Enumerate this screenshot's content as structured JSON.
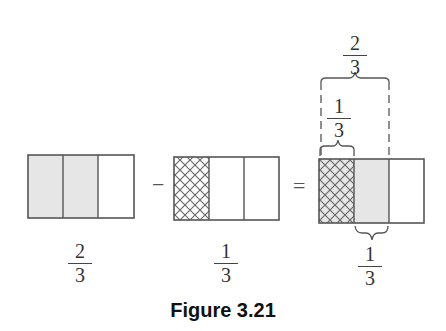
{
  "figure": {
    "caption": "Figure 3.21",
    "operators": {
      "minus": "−",
      "equals": "="
    },
    "left_bar": {
      "parts": 3,
      "shaded": 2,
      "label": {
        "numerator": "2",
        "denominator": "3"
      }
    },
    "middle_bar": {
      "parts": 3,
      "hatched": 1,
      "label": {
        "numerator": "1",
        "denominator": "3"
      }
    },
    "result_bar": {
      "parts": 3,
      "hatched_and_shaded": 1,
      "shaded": 1,
      "top_brace_outer": {
        "numerator": "2",
        "denominator": "3"
      },
      "top_brace_inner": {
        "numerator": "1",
        "denominator": "3"
      },
      "bottom_brace": {
        "numerator": "1",
        "denominator": "3"
      }
    },
    "colors": {
      "shade": "#e6e6e6",
      "stroke": "#555555",
      "hatch": "#666666"
    }
  }
}
